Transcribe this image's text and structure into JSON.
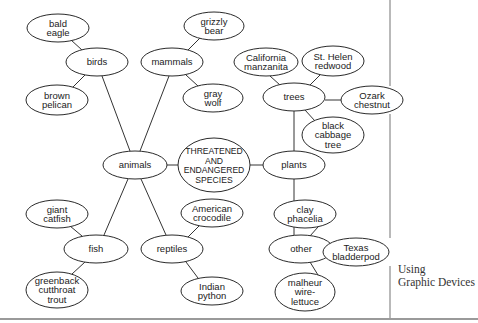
{
  "diagram": {
    "center": {
      "id": "center",
      "lines": [
        "THREATENED",
        "AND",
        "ENDANGERED",
        "SPECIES"
      ],
      "cx": 214,
      "cy": 165,
      "rx": 36,
      "ry": 27
    },
    "nodes": [
      {
        "id": "animals",
        "lines": [
          "animals"
        ],
        "cx": 135,
        "cy": 165,
        "rx": 32,
        "ry": 14
      },
      {
        "id": "plants",
        "lines": [
          "plants"
        ],
        "cx": 294,
        "cy": 165,
        "rx": 31,
        "ry": 14
      },
      {
        "id": "birds",
        "lines": [
          "birds"
        ],
        "cx": 97,
        "cy": 62,
        "rx": 31,
        "ry": 14
      },
      {
        "id": "mammals",
        "lines": [
          "mammals"
        ],
        "cx": 172,
        "cy": 62,
        "rx": 31,
        "ry": 14
      },
      {
        "id": "fish",
        "lines": [
          "fish"
        ],
        "cx": 96,
        "cy": 249,
        "rx": 32,
        "ry": 14
      },
      {
        "id": "reptiles",
        "lines": [
          "reptiles"
        ],
        "cx": 172,
        "cy": 249,
        "rx": 31,
        "ry": 14
      },
      {
        "id": "trees",
        "lines": [
          "trees"
        ],
        "cx": 294,
        "cy": 97,
        "rx": 31,
        "ry": 14
      },
      {
        "id": "other",
        "lines": [
          "other"
        ],
        "cx": 301,
        "cy": 249,
        "rx": 32,
        "ry": 14
      },
      {
        "id": "bald-eagle",
        "lines": [
          "bald",
          "eagle"
        ],
        "cx": 58,
        "cy": 28,
        "rx": 31,
        "ry": 14
      },
      {
        "id": "brown-pelican",
        "lines": [
          "brown",
          "pelican"
        ],
        "cx": 57,
        "cy": 100,
        "rx": 31,
        "ry": 15
      },
      {
        "id": "grizzly-bear",
        "lines": [
          "grizzly",
          "bear"
        ],
        "cx": 214,
        "cy": 26,
        "rx": 30,
        "ry": 14
      },
      {
        "id": "gray-wolf",
        "lines": [
          "gray",
          "wolf"
        ],
        "cx": 213,
        "cy": 98,
        "rx": 30,
        "ry": 14
      },
      {
        "id": "giant-catfish",
        "lines": [
          "giant",
          "catfish"
        ],
        "cx": 57,
        "cy": 214,
        "rx": 31,
        "ry": 14
      },
      {
        "id": "greenback-cutthroat-trout",
        "lines": [
          "greenback",
          "cutthroat",
          "trout"
        ],
        "cx": 57,
        "cy": 290,
        "rx": 31,
        "ry": 18
      },
      {
        "id": "american-crocodile",
        "lines": [
          "American",
          "crocodile"
        ],
        "cx": 212,
        "cy": 213,
        "rx": 31,
        "ry": 14
      },
      {
        "id": "indian-python",
        "lines": [
          "Indian",
          "python"
        ],
        "cx": 212,
        "cy": 291,
        "rx": 31,
        "ry": 14
      },
      {
        "id": "california-manzanita",
        "lines": [
          "California",
          "manzanita"
        ],
        "cx": 266,
        "cy": 62,
        "rx": 32,
        "ry": 14
      },
      {
        "id": "st-helen-redwood",
        "lines": [
          "St. Helen",
          "redwood"
        ],
        "cx": 333,
        "cy": 61,
        "rx": 31,
        "ry": 15
      },
      {
        "id": "ozark-chestnut",
        "lines": [
          "Ozark",
          "chestnut"
        ],
        "cx": 372,
        "cy": 100,
        "rx": 31,
        "ry": 14
      },
      {
        "id": "black-cabbage-tree",
        "lines": [
          "black",
          "cabbage",
          "tree"
        ],
        "cx": 333,
        "cy": 135,
        "rx": 31,
        "ry": 18
      },
      {
        "id": "clay-phacelia",
        "lines": [
          "clay",
          "phacelia"
        ],
        "cx": 305,
        "cy": 214,
        "rx": 31,
        "ry": 14
      },
      {
        "id": "texas-bladderpod",
        "lines": [
          "Texas",
          "bladderpod"
        ],
        "cx": 356,
        "cy": 252,
        "rx": 33,
        "ry": 14
      },
      {
        "id": "malheur-wire-lettuce",
        "lines": [
          "malheur",
          "wire-",
          "lettuce"
        ],
        "cx": 305,
        "cy": 292,
        "rx": 30,
        "ry": 19
      }
    ],
    "edges": [
      {
        "from": "center",
        "to": "animals",
        "x1": 178,
        "y1": 165,
        "x2": 167,
        "y2": 165
      },
      {
        "from": "center",
        "to": "plants",
        "x1": 250,
        "y1": 165,
        "x2": 263,
        "y2": 165
      },
      {
        "from": "animals",
        "to": "birds",
        "x1": 130,
        "y1": 151,
        "x2": 102,
        "y2": 76
      },
      {
        "from": "animals",
        "to": "mammals",
        "x1": 140,
        "y1": 151,
        "x2": 169,
        "y2": 76
      },
      {
        "from": "animals",
        "to": "fish",
        "x1": 128,
        "y1": 179,
        "x2": 104,
        "y2": 235
      },
      {
        "from": "animals",
        "to": "reptiles",
        "x1": 141,
        "y1": 179,
        "x2": 166,
        "y2": 235
      },
      {
        "from": "birds",
        "to": "bald-eagle",
        "x1": 82,
        "y1": 50,
        "x2": 71,
        "y2": 40
      },
      {
        "from": "birds",
        "to": "brown-pelican",
        "x1": 85,
        "y1": 75,
        "x2": 73,
        "y2": 87
      },
      {
        "from": "mammals",
        "to": "grizzly-bear",
        "x1": 188,
        "y1": 50,
        "x2": 200,
        "y2": 38
      },
      {
        "from": "mammals",
        "to": "gray-wolf",
        "x1": 186,
        "y1": 75,
        "x2": 198,
        "y2": 86
      },
      {
        "from": "fish",
        "to": "giant-catfish",
        "x1": 82,
        "y1": 236,
        "x2": 70,
        "y2": 226
      },
      {
        "from": "fish",
        "to": "greenback-cutthroat-trout",
        "x1": 85,
        "y1": 262,
        "x2": 72,
        "y2": 274
      },
      {
        "from": "reptiles",
        "to": "american-crocodile",
        "x1": 188,
        "y1": 237,
        "x2": 199,
        "y2": 226
      },
      {
        "from": "reptiles",
        "to": "indian-python",
        "x1": 186,
        "y1": 262,
        "x2": 198,
        "y2": 278
      },
      {
        "from": "plants",
        "to": "trees",
        "x1": 294,
        "y1": 151,
        "x2": 294,
        "y2": 111
      },
      {
        "from": "plants",
        "to": "other",
        "x1": 294,
        "y1": 179,
        "x2": 294,
        "y2": 235
      },
      {
        "from": "trees",
        "to": "california-manzanita",
        "x1": 280,
        "y1": 85,
        "x2": 270,
        "y2": 76
      },
      {
        "from": "trees",
        "to": "st-helen-redwood",
        "x1": 310,
        "y1": 85,
        "x2": 320,
        "y2": 75
      },
      {
        "from": "trees",
        "to": "ozark-chestnut",
        "x1": 325,
        "y1": 100,
        "x2": 341,
        "y2": 100
      },
      {
        "from": "trees",
        "to": "black-cabbage-tree",
        "x1": 305,
        "y1": 110,
        "x2": 315,
        "y2": 121
      },
      {
        "from": "other",
        "to": "clay-phacelia",
        "x1": 310,
        "y1": 236,
        "x2": 318,
        "y2": 227
      },
      {
        "from": "other",
        "to": "texas-bladderpod",
        "x1": 333,
        "y1": 251,
        "x2": 323,
        "y2": 251
      },
      {
        "from": "other",
        "to": "malheur-wire-lettuce",
        "x1": 310,
        "y1": 262,
        "x2": 318,
        "y2": 275
      }
    ],
    "divider": {
      "x": 390,
      "segments": [
        [
          0,
          86
        ],
        [
          114,
          238
        ],
        [
          266,
          318
        ]
      ]
    },
    "bottom_rule_y": 319
  },
  "caption": {
    "line1": "Using",
    "line2": "Graphic Devices"
  }
}
